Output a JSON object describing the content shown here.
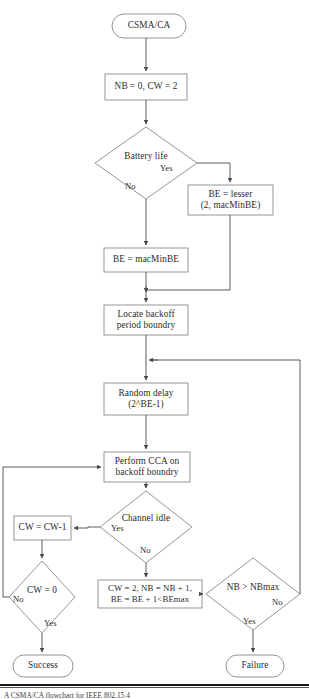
{
  "diagram": {
    "title": "CSMA/CA flowchart",
    "colors": {
      "stroke": "#8a8a8a",
      "arrow": "#4a4a4a",
      "text": "#2b2b2b",
      "background": "#ffffff",
      "rule": "#1a1a1a"
    },
    "nodes": [
      {
        "id": "start",
        "type": "terminal",
        "label": "CSMA/CA"
      },
      {
        "id": "init",
        "type": "process",
        "label": "NB = 0, CW = 2"
      },
      {
        "id": "battery",
        "type": "decision",
        "label": "Battery life"
      },
      {
        "id": "be_lesser",
        "type": "process",
        "line1": "BE = lesser",
        "line2": "(2, macMinBE)"
      },
      {
        "id": "be_macminbe",
        "type": "process",
        "label": "BE = macMinBE"
      },
      {
        "id": "locate",
        "type": "process",
        "line1": "Locate backoff",
        "line2": "period boundry"
      },
      {
        "id": "random_delay",
        "type": "process",
        "line1": "Random delay",
        "line2": "(2^BE-1)"
      },
      {
        "id": "perform_cca",
        "type": "process",
        "line1": "Perform CCA on",
        "line2": "backoff boundry"
      },
      {
        "id": "channel_idle",
        "type": "decision",
        "label": "Channel idle"
      },
      {
        "id": "cw_dec",
        "type": "process",
        "label": "CW = CW-1"
      },
      {
        "id": "cw_zero",
        "type": "decision",
        "label": "CW = 0"
      },
      {
        "id": "backoff_inc",
        "type": "process",
        "line1": "CW = 2, NB = NB + 1,",
        "line2": "BE = BE + 1<BEmax"
      },
      {
        "id": "nb_max",
        "type": "decision",
        "label": "NB > NBmax"
      },
      {
        "id": "success",
        "type": "terminal",
        "label": "Success"
      },
      {
        "id": "failure",
        "type": "terminal",
        "label": "Failure"
      }
    ],
    "edge_labels": [
      {
        "id": "battery-yes",
        "text": "Yes"
      },
      {
        "id": "battery-no",
        "text": "No"
      },
      {
        "id": "channel-yes",
        "text": "Yes"
      },
      {
        "id": "channel-no",
        "text": "No"
      },
      {
        "id": "cwzero-no",
        "text": "No"
      },
      {
        "id": "cwzero-yes",
        "text": "Yes"
      },
      {
        "id": "nbmax-no",
        "text": "No"
      },
      {
        "id": "nbmax-yes",
        "text": "Yes"
      }
    ],
    "caption": "A CSMA/CA flowchart for IEEE 802.15.4"
  }
}
